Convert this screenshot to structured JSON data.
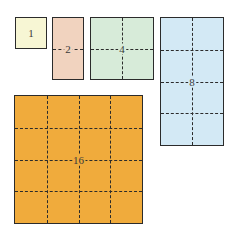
{
  "diagram": {
    "shapes": [
      {
        "id": "one",
        "label": "1",
        "units": 1,
        "cols": 1,
        "rows": 1,
        "color": "#f7f6d4",
        "x": 15,
        "y": 17,
        "w": 32,
        "h": 32
      },
      {
        "id": "two",
        "label": "2",
        "units": 2,
        "cols": 1,
        "rows": 2,
        "color": "#f1d3bf",
        "x": 52,
        "y": 17,
        "w": 32,
        "h": 63
      },
      {
        "id": "four",
        "label": "4",
        "units": 4,
        "cols": 2,
        "rows": 2,
        "color": "#d7ebd9",
        "x": 90,
        "y": 17,
        "w": 64,
        "h": 63
      },
      {
        "id": "eight",
        "label": "8",
        "units": 8,
        "cols": 2,
        "rows": 4,
        "color": "#d3e9f5",
        "x": 160,
        "y": 17,
        "w": 64,
        "h": 129
      },
      {
        "id": "sixteen",
        "label": "16",
        "units": 16,
        "cols": 4,
        "rows": 4,
        "color": "#f0ab3c",
        "x": 14,
        "y": 95,
        "w": 129,
        "h": 129
      }
    ]
  }
}
